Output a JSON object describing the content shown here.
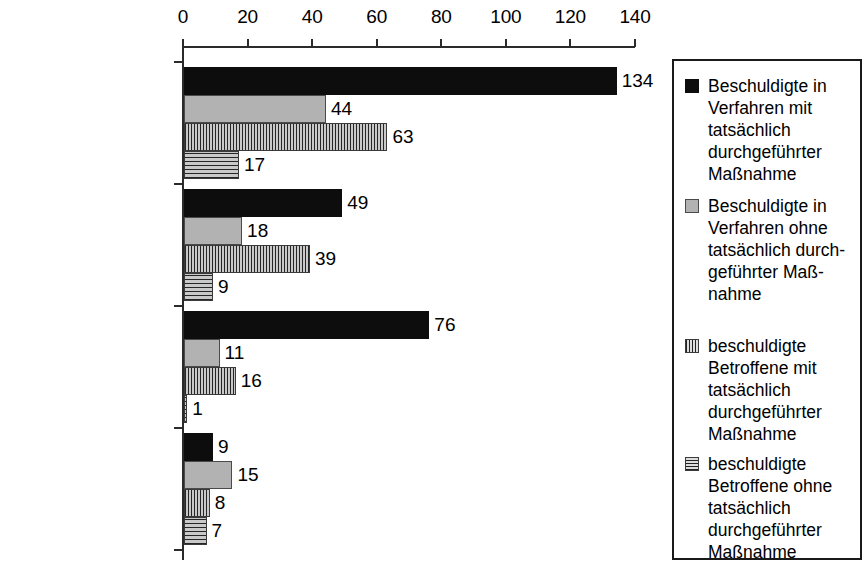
{
  "chart_data": {
    "type": "bar",
    "orientation": "horizontal",
    "title": "",
    "xlabel": "",
    "ylabel": "",
    "xlim": [
      0,
      140
    ],
    "xticks": [
      0,
      20,
      40,
      60,
      80,
      100,
      120,
      140
    ],
    "grid": false,
    "legend_position": "right",
    "categories": [
      "Alle",
      "Mord/Totschlag",
      "BtMG (inkl. Komb.)",
      "Sonstige"
    ],
    "series": [
      {
        "name": "Beschuldigte in\nVerfahren mit\ntatsächlich\ndurchgeführter\nMaßnahme",
        "pattern": "solid-black",
        "color": "#0d0d0d",
        "values": [
          134,
          49,
          76,
          9
        ]
      },
      {
        "name": "Beschuldigte in\nVerfahren ohne\ntatsächlich durch-\ngeführter Maß-\nnahme",
        "pattern": "solid-gray",
        "color": "#b2b2b2",
        "values": [
          44,
          18,
          11,
          15
        ]
      },
      {
        "name": "beschuldigte\nBetroffene mit\ntatsächlich\ndurchgeführter\nMaßnahme",
        "pattern": "vertical-stripes",
        "color": "#8e8e8e",
        "values": [
          63,
          39,
          16,
          8
        ]
      },
      {
        "name": "beschuldigte\nBetroffene ohne\ntatsächlich\ndurchgeführter\nMaßnahme",
        "pattern": "horizontal-stripes",
        "color": "#8e8e8e",
        "values": [
          17,
          9,
          1,
          7
        ]
      }
    ]
  },
  "axis": {
    "tick_labels": [
      "0",
      "20",
      "40",
      "60",
      "80",
      "100",
      "120",
      "140"
    ]
  },
  "legend": {
    "items": [
      "Beschuldigte in\nVerfahren mit\ntatsächlich\ndurchgeführter\nMaßnahme",
      "Beschuldigte in\nVerfahren ohne\ntatsächlich durch-\ngeführter Maß-\nnahme",
      "beschuldigte\nBetroffene mit\ntatsächlich\ndurchgeführter\nMaßnahme",
      "beschuldigte\nBetroffene ohne\ntatsächlich\ndurchgeführter\nMaßnahme"
    ]
  }
}
